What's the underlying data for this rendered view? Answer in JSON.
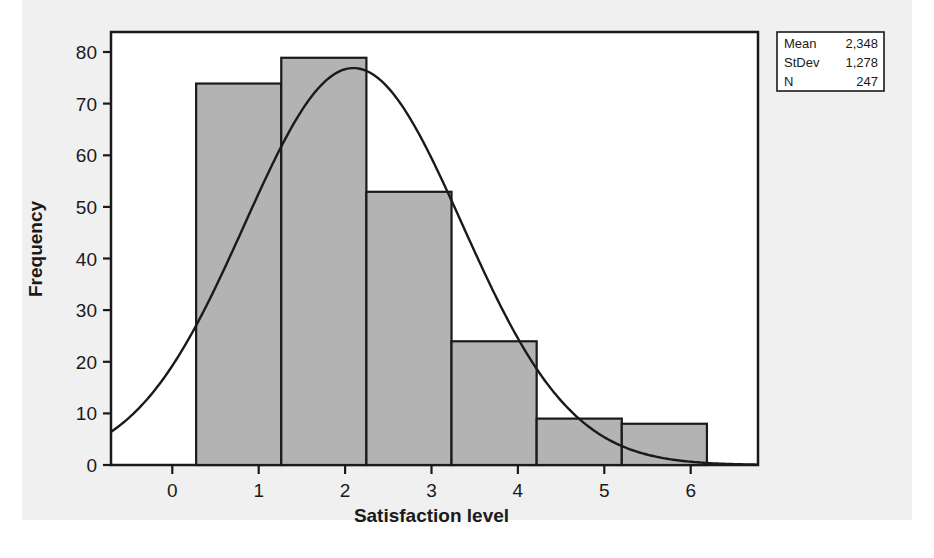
{
  "chart_data": {
    "type": "bar",
    "title": "",
    "subtitle": "",
    "xlabel": "Satisfaction level",
    "ylabel": "Frequency",
    "categories": [
      "1",
      "2",
      "3",
      "4",
      "5",
      "6"
    ],
    "values": [
      74,
      79,
      53,
      24,
      9,
      8
    ],
    "bin_edges": [
      0.5,
      1.5,
      2.5,
      3.5,
      4.5,
      5.5,
      6.5
    ],
    "bin_width": 1,
    "xlim": [
      -0.5,
      7.1
    ],
    "ylim": [
      0,
      84
    ],
    "xticks": [
      0,
      1,
      2,
      3,
      4,
      5,
      6
    ],
    "yticks": [
      0,
      10,
      20,
      30,
      40,
      50,
      60,
      70,
      80
    ],
    "grid": false,
    "legend": "none",
    "overlay": {
      "type": "line",
      "name": "normal-curve",
      "description": "fitted normal distribution curve",
      "mean": 2.348,
      "stdev": 1.278,
      "n": 247,
      "scale": 247,
      "peak_value": 77
    },
    "bar_fill_color": "#b3b3b3",
    "bar_edge_color": "#1a1a1a",
    "curve_color": "#1a1a1a",
    "background_color": "#f0f0f0",
    "plot_area_color": "#ffffff"
  },
  "stats_box": {
    "rows": [
      {
        "label": "Mean",
        "value": "2,348"
      },
      {
        "label": "StDev",
        "value": "1,278"
      },
      {
        "label": "N",
        "value": "247"
      }
    ],
    "border_color": "#1a1a1a"
  },
  "axes": {
    "y_title": "Frequency",
    "x_title": "Satisfaction level",
    "y_ticks": [
      "0",
      "10",
      "20",
      "30",
      "40",
      "50",
      "60",
      "70",
      "80"
    ],
    "x_ticks": [
      "0",
      "1",
      "2",
      "3",
      "4",
      "5",
      "6"
    ]
  }
}
